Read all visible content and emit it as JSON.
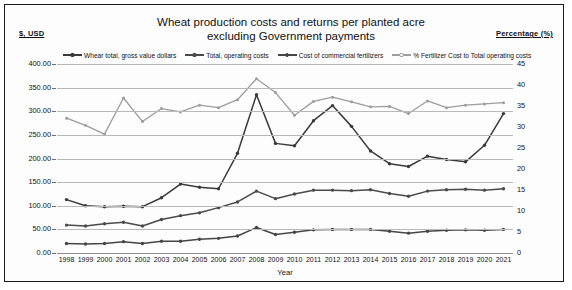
{
  "axis_captions": {
    "left": "$, USD",
    "right": "Percentage (%)"
  },
  "title": {
    "line1": "Wheat production costs and returns per planted acre",
    "line2": "excluding Government payments"
  },
  "xaxis_title": "Year",
  "legend": [
    {
      "label": "Whear total, gross value dollars",
      "color": "#3a3a3a"
    },
    {
      "label": "Total, operating costs",
      "color": "#4a4a4a"
    },
    {
      "label": "Cost of commercial fertilizers",
      "color": "#454545"
    },
    {
      "label": "% Fertilizer Cost to Total operating costs",
      "color": "#9d9d9d"
    }
  ],
  "chart_data": {
    "type": "line",
    "title": "Wheat production costs and returns per planted acre excluding Government payments",
    "xlabel": "Year",
    "ylabel": "$, USD",
    "y2label": "Percentage (%)",
    "grid": true,
    "legend_position": "top",
    "ylim": [
      0,
      400
    ],
    "y2lim": [
      0,
      45
    ],
    "yticks": [
      "0.00",
      "50.00",
      "100.00",
      "150.00",
      "200.00",
      "250.00",
      "300.00",
      "350.00",
      "400.00"
    ],
    "y2ticks": [
      "0",
      "5",
      "10",
      "15",
      "20",
      "25",
      "30",
      "35",
      "40",
      "45"
    ],
    "categories": [
      1998,
      1999,
      2000,
      2001,
      2002,
      2003,
      2004,
      2005,
      2006,
      2007,
      2008,
      2009,
      2010,
      2011,
      2012,
      2013,
      2014,
      2015,
      2016,
      2017,
      2018,
      2019,
      2020,
      2021
    ],
    "series": [
      {
        "name": "Whear total, gross value dollars",
        "axis": "left",
        "color": "#3a3a3a",
        "values": [
          113,
          100,
          98,
          99,
          98,
          117,
          146,
          139,
          136,
          211,
          335,
          232,
          227,
          280,
          312,
          268,
          216,
          189,
          183,
          205,
          198,
          193,
          228,
          295
        ]
      },
      {
        "name": "Total, operating costs",
        "axis": "left",
        "color": "#4a4a4a",
        "values": [
          59,
          57,
          62,
          65,
          57,
          71,
          79,
          85,
          96,
          108,
          131,
          115,
          125,
          133,
          133,
          132,
          134,
          126,
          120,
          131,
          134,
          135,
          133,
          136
        ]
      },
      {
        "name": "Cost of commercial fertilizers",
        "axis": "left",
        "color": "#454545",
        "values": [
          20,
          19,
          20,
          24,
          20,
          25,
          25,
          29,
          31,
          36,
          54,
          39,
          44,
          49,
          50,
          50,
          50,
          46,
          42,
          46,
          48,
          49,
          48,
          50
        ]
      },
      {
        "name": "% Fertilizer Cost to Total operating costs",
        "axis": "right",
        "color": "#9d9d9d",
        "values": [
          32.1,
          30.4,
          28.3,
          36.9,
          31.3,
          34.4,
          33.6,
          35.2,
          34.6,
          36.5,
          41.5,
          38.2,
          32.8,
          36.1,
          37.1,
          36.0,
          34.8,
          34.9,
          33.2,
          36.2,
          34.6,
          35.2,
          35.5,
          35.8
        ]
      }
    ]
  }
}
